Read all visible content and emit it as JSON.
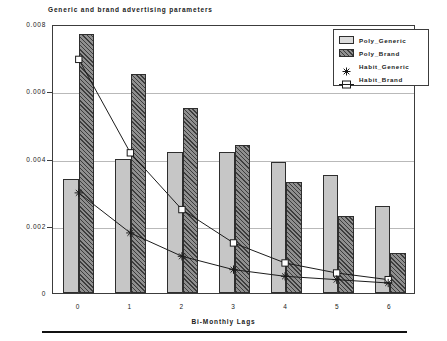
{
  "chart_data": {
    "type": "bar",
    "title": "Generic and brand advertising parameters",
    "xlabel": "Bi-Monthly Lags",
    "ylabel": "",
    "categories": [
      "0",
      "1",
      "2",
      "3",
      "4",
      "5",
      "6"
    ],
    "ylim": [
      0,
      0.008
    ],
    "yticks": [
      0,
      0.002,
      0.004,
      0.006,
      0.008
    ],
    "ytick_labels": [
      "0",
      "0.002",
      "0.004",
      "0.006",
      "0.008"
    ],
    "grid": true,
    "legend_position": "top-right",
    "series": [
      {
        "name": "Poly_Generic",
        "kind": "bar",
        "marker": "filled-light-rectangle",
        "values": [
          0.0034,
          0.004,
          0.0042,
          0.0042,
          0.0039,
          0.0035,
          0.0026
        ]
      },
      {
        "name": "Poly_Brand",
        "kind": "bar",
        "marker": "hatched-dark-rectangle",
        "values": [
          0.0077,
          0.0065,
          0.0055,
          0.0044,
          0.0033,
          0.0023,
          0.0012
        ]
      },
      {
        "name": "Habit_Generic",
        "kind": "line",
        "marker": "asterisk",
        "values": [
          0.003,
          0.0018,
          0.0011,
          0.0007,
          0.0005,
          0.0004,
          0.0003
        ]
      },
      {
        "name": "Habit_Brand",
        "kind": "line",
        "marker": "square",
        "values": [
          0.007,
          0.0042,
          0.0025,
          0.0015,
          0.0009,
          0.0006,
          0.0004
        ]
      }
    ]
  },
  "colors": {
    "generic_bar": "#c6c6c6",
    "brand_bar": "#8f8f8f",
    "axis": "#3c3c3c",
    "grid": "#b9b9b9",
    "line": "#1a1a1a",
    "text": "#1a1a1a"
  },
  "legend": {
    "items": [
      {
        "label": "Poly_Generic"
      },
      {
        "label": "Poly_Brand"
      },
      {
        "label": "Habit_Generic"
      },
      {
        "label": "Habit_Brand"
      }
    ]
  }
}
